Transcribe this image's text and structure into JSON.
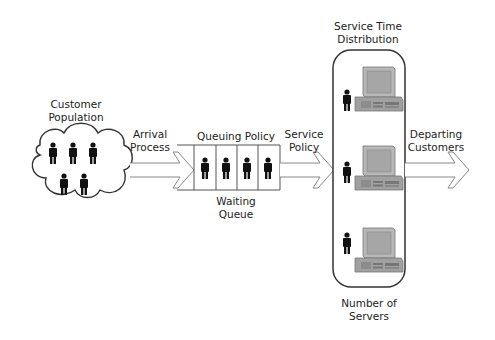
{
  "diagram": {
    "labels": {
      "customer_population_line1": "Customer",
      "customer_population_line2": "Population",
      "arrival_process_line1": "Arrival",
      "arrival_process_line2": "Process",
      "queuing_policy": "Queuing Policy",
      "waiting_queue_line1": "Waiting",
      "waiting_queue_line2": "Queue",
      "service_policy_line1": "Service",
      "service_policy_line2": "Policy",
      "service_time_line1": "Service Time",
      "service_time_line2": "Distribution",
      "departing_line1": "Departing",
      "departing_line2": "Customers",
      "servers_line1": "Number of",
      "servers_line2": "Servers"
    },
    "nodes": [
      {
        "id": "population",
        "shape": "cloud",
        "people": 5
      },
      {
        "id": "queue",
        "shape": "slots",
        "slots": 4,
        "people": 4
      },
      {
        "id": "servers",
        "shape": "rounded-rect",
        "servers": 3
      }
    ],
    "edges": [
      {
        "from": "population",
        "to": "queue",
        "label": "Arrival Process"
      },
      {
        "from": "queue",
        "to": "servers",
        "label": "Service Policy"
      },
      {
        "from": "servers",
        "to": "exit",
        "label": "Departing Customers"
      }
    ],
    "colors": {
      "stroke": "#333333",
      "person": "#111111",
      "arrow_stroke": "#888888",
      "computer": "#9a9a9a"
    }
  }
}
